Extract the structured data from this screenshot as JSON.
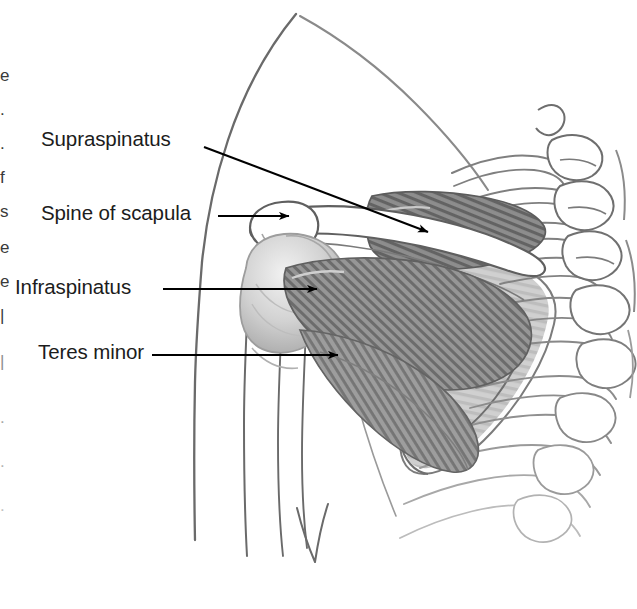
{
  "figure": {
    "style": "grayscale halftone line drawing on white background",
    "background_color": "#ffffff",
    "line_color": "#555555",
    "arrow_color": "#000000",
    "text_color": "#1c1c1c",
    "muscle_fill_dark": "#6e6e6e",
    "muscle_fill_mid": "#8f8f8f",
    "muscle_fill_light": "#b5b5b5",
    "bone_fill": "#ffffff",
    "shade_light": "#d8d8d8"
  },
  "labels": [
    {
      "id": "supraspinatus",
      "text": "Supraspinatus",
      "leader": "diagonal",
      "arrow_target": "supraspinatus muscle belly above the spine of the scapula"
    },
    {
      "id": "spine-of-scapula",
      "text": "Spine of scapula",
      "leader": "horizontal",
      "arrow_target": "acromion / spine of scapula"
    },
    {
      "id": "infraspinatus",
      "text": "Infraspinatus",
      "leader": "horizontal",
      "arrow_target": "infraspinatus muscle at the greater tubercle of the humerus"
    },
    {
      "id": "teres-minor",
      "text": "Teres minor",
      "leader": "horizontal",
      "arrow_target": "teres minor muscle below the infraspinatus"
    }
  ],
  "anatomical_structures": [
    "neck and trapezius contour",
    "deltoid / shoulder outline",
    "upper arm (humerus) outline",
    "acromion",
    "spine of scapula",
    "head of humerus with greater tubercle",
    "supraspinatus muscle",
    "infraspinatus muscle",
    "teres minor muscle",
    "body of scapula",
    "lateral border of scapula",
    "ribs",
    "thoracic vertebrae with spinous and transverse processes"
  ],
  "edge_fragments": {
    "note": "partial cut-off glyphs from an adjacent text column at the left margin",
    "glyphs": [
      "e",
      ".",
      ".",
      "f",
      "s",
      "e",
      "e",
      "|",
      "|",
      ".",
      ".",
      "."
    ]
  }
}
